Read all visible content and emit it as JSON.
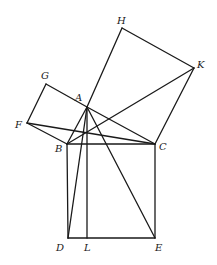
{
  "diagram": {
    "stroke_color": "#1a1a1a",
    "background": "#ffffff",
    "points": {
      "A": {
        "x": 87,
        "y": 107
      },
      "B": {
        "x": 67,
        "y": 144
      },
      "C": {
        "x": 155,
        "y": 144
      },
      "D": {
        "x": 68,
        "y": 238
      },
      "E": {
        "x": 155,
        "y": 238
      },
      "L": {
        "x": 87,
        "y": 238
      },
      "F": {
        "x": 27,
        "y": 123
      },
      "G": {
        "x": 46,
        "y": 84
      },
      "H": {
        "x": 122,
        "y": 28
      },
      "K": {
        "x": 194,
        "y": 68
      }
    },
    "labels": [
      {
        "text": "A",
        "x": 75,
        "y": 101
      },
      {
        "text": "B",
        "x": 55,
        "y": 152
      },
      {
        "text": "C",
        "x": 159,
        "y": 150
      },
      {
        "text": "D",
        "x": 56,
        "y": 251
      },
      {
        "text": "E",
        "x": 155,
        "y": 251
      },
      {
        "text": "L",
        "x": 84,
        "y": 251
      },
      {
        "text": "F",
        "x": 15,
        "y": 128
      },
      {
        "text": "G",
        "x": 41,
        "y": 79
      },
      {
        "text": "H",
        "x": 117,
        "y": 24
      },
      {
        "text": "K",
        "x": 197,
        "y": 68
      }
    ],
    "segments": [
      [
        "A",
        "B"
      ],
      [
        "A",
        "C"
      ],
      [
        "B",
        "C"
      ],
      [
        "A",
        "G"
      ],
      [
        "G",
        "F"
      ],
      [
        "F",
        "B"
      ],
      [
        "A",
        "H"
      ],
      [
        "H",
        "K"
      ],
      [
        "K",
        "C"
      ],
      [
        "B",
        "D"
      ],
      [
        "D",
        "E"
      ],
      [
        "E",
        "C"
      ],
      [
        "A",
        "L"
      ],
      [
        "A",
        "D"
      ],
      [
        "A",
        "E"
      ],
      [
        "F",
        "C"
      ],
      [
        "B",
        "K"
      ]
    ]
  }
}
